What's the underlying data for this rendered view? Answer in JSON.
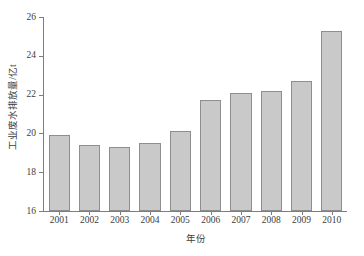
{
  "chart_data": {
    "type": "bar",
    "title": "",
    "xlabel": "年份",
    "ylabel": "工业废水排放量/亿t",
    "categories": [
      "2001",
      "2002",
      "2003",
      "2004",
      "2005",
      "2006",
      "2007",
      "2008",
      "2009",
      "2010"
    ],
    "values": [
      19.9,
      19.4,
      19.3,
      19.5,
      20.1,
      21.7,
      22.1,
      22.2,
      22.7,
      25.3
    ],
    "ylim": [
      16,
      26
    ],
    "yticks": [
      16,
      18,
      20,
      22,
      24,
      26
    ],
    "ytick_labels": [
      "16",
      "18",
      "20",
      "22",
      "24",
      "26"
    ],
    "grid": false,
    "legend": null,
    "bar_color": "#c9c9c9",
    "bar_edge_color": "#8e8e8e",
    "axis_color": "#7d7d7d",
    "text_color": "#3d3d3d",
    "background": "#ffffff"
  }
}
